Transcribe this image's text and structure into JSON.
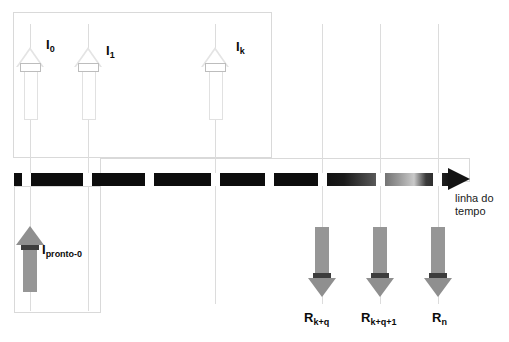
{
  "figure": {
    "type": "timeline-diagram",
    "background_color": "#ffffff",
    "timeline_color": "#0d0d0d",
    "arrow_fill_color": "#8f8f8f",
    "guide_line_color": "#dcdcdc"
  },
  "timeline": {
    "caption_line1": "linha do",
    "caption_line2": "tempo",
    "arrowhead_name": "timeline-arrowhead"
  },
  "top_arrows": [
    {
      "label_base": "I",
      "label_sub": "0",
      "name": "arrival-arrow-i0"
    },
    {
      "label_base": "I",
      "label_sub": "1",
      "name": "arrival-arrow-i1"
    },
    {
      "label_base": "I",
      "label_sub": "k",
      "name": "arrival-arrow-ik"
    }
  ],
  "bottom_left_arrow": {
    "label_base": "I",
    "label_sub": "pronto-0",
    "name": "ready-arrow-ipronto0"
  },
  "bottom_arrows": [
    {
      "label_base": "R",
      "label_sub": "k+q",
      "name": "response-arrow-rkq"
    },
    {
      "label_base": "R",
      "label_sub": "k+q+1",
      "name": "response-arrow-rkq1"
    },
    {
      "label_base": "R",
      "label_sub": "n",
      "name": "response-arrow-rn"
    }
  ],
  "ticks": {
    "count": 8,
    "color": "#ffffff"
  }
}
